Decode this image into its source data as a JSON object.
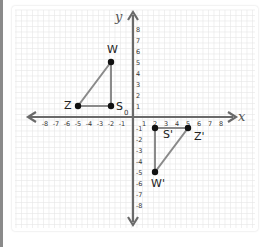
{
  "diagram": {
    "type": "coordinate-plane",
    "axes": {
      "x_label": "x",
      "y_label": "y",
      "origin_label": "0",
      "x_ticks": [
        -8,
        -7,
        -6,
        -5,
        -4,
        -3,
        -2,
        -1,
        1,
        2,
        3,
        4,
        5,
        6,
        7,
        8
      ],
      "y_ticks": [
        8,
        7,
        6,
        5,
        4,
        3,
        2,
        1,
        -1,
        -2,
        -3,
        -4,
        -5,
        -6,
        -7,
        -8
      ],
      "range": [
        -8,
        8
      ]
    },
    "shapes": [
      {
        "name": "original-triangle",
        "vertices": [
          {
            "label": "W",
            "x": -2,
            "y": 5
          },
          {
            "label": "Z",
            "x": -5,
            "y": 1
          },
          {
            "label": "S",
            "x": -2,
            "y": 1
          }
        ]
      },
      {
        "name": "image-triangle",
        "vertices": [
          {
            "label": "S'",
            "x": 2,
            "y": -1
          },
          {
            "label": "Z'",
            "x": 5,
            "y": -1
          },
          {
            "label": "W'",
            "x": 2,
            "y": -5
          }
        ]
      }
    ],
    "colors": {
      "axis": "#6a6a6a",
      "segment": "#8a8a8a",
      "point": "#111111",
      "grid": "#e6e6e6",
      "text": "#333333"
    }
  }
}
